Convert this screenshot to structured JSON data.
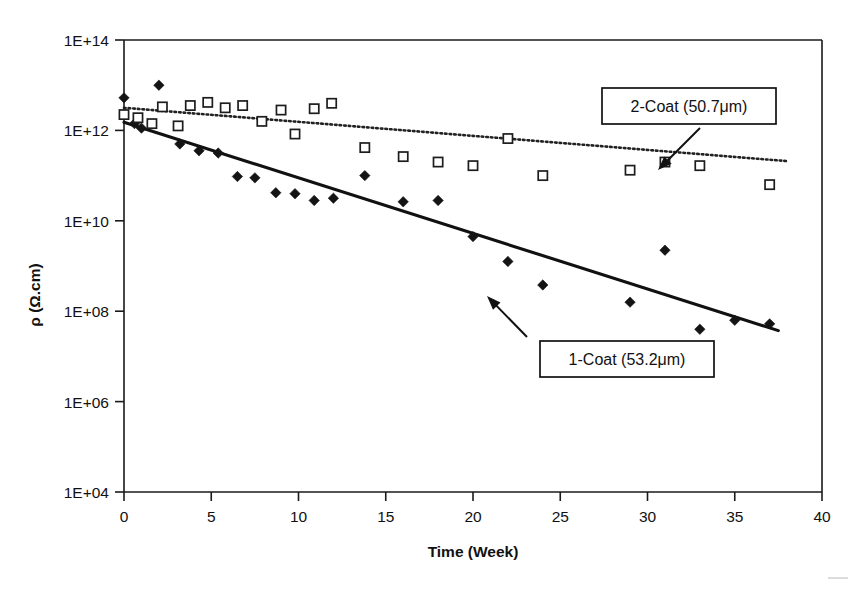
{
  "chart_data": {
    "type": "scatter",
    "title": "",
    "xlabel": "Time (Week)",
    "ylabel": "ρ (Ω.cm)",
    "xlim": [
      0,
      40
    ],
    "ylim_exponent": [
      4,
      14
    ],
    "y_scale": "log",
    "grid": false,
    "legend_position": "inside-annotations",
    "x_ticks": [
      "0",
      "5",
      "10",
      "15",
      "20",
      "25",
      "30",
      "35",
      "40"
    ],
    "x_tick_values": [
      0,
      5,
      10,
      15,
      20,
      25,
      30,
      35,
      40
    ],
    "y_ticks": [
      "1E+04",
      "1E+06",
      "1E+08",
      "1E+10",
      "1E+12",
      "1E+14"
    ],
    "y_tick_exponents": [
      4,
      6,
      8,
      10,
      12,
      14
    ],
    "series": [
      {
        "name": "1-Coat (53.2μm)",
        "marker": "filled-diamond",
        "fit_style": "solid",
        "fit_start": {
          "x": 0,
          "y_exponent": 12.18
        },
        "fit_end": {
          "x": 37.5,
          "y_exponent": 7.57
        },
        "points": [
          {
            "x": 0.0,
            "y_exponent": 12.72
          },
          {
            "x": 0.6,
            "y_exponent": 12.15
          },
          {
            "x": 1.0,
            "y_exponent": 12.05
          },
          {
            "x": 2.0,
            "y_exponent": 13.0
          },
          {
            "x": 3.2,
            "y_exponent": 11.7
          },
          {
            "x": 4.3,
            "y_exponent": 11.55
          },
          {
            "x": 5.4,
            "y_exponent": 11.5
          },
          {
            "x": 6.5,
            "y_exponent": 10.98
          },
          {
            "x": 7.5,
            "y_exponent": 10.95
          },
          {
            "x": 8.7,
            "y_exponent": 10.62
          },
          {
            "x": 9.8,
            "y_exponent": 10.6
          },
          {
            "x": 10.9,
            "y_exponent": 10.45
          },
          {
            "x": 12.0,
            "y_exponent": 10.5
          },
          {
            "x": 13.8,
            "y_exponent": 11.0
          },
          {
            "x": 16.0,
            "y_exponent": 10.42
          },
          {
            "x": 18.0,
            "y_exponent": 10.45
          },
          {
            "x": 20.0,
            "y_exponent": 9.65
          },
          {
            "x": 22.0,
            "y_exponent": 9.1
          },
          {
            "x": 24.0,
            "y_exponent": 8.58
          },
          {
            "x": 29.0,
            "y_exponent": 8.2
          },
          {
            "x": 31.0,
            "y_exponent": 9.35
          },
          {
            "x": 33.0,
            "y_exponent": 7.6
          },
          {
            "x": 35.0,
            "y_exponent": 7.8
          },
          {
            "x": 37.0,
            "y_exponent": 7.72
          }
        ]
      },
      {
        "name": "2-Coat (50.7μm)",
        "marker": "open-square",
        "fit_style": "dotted",
        "fit_start": {
          "x": 0,
          "y_exponent": 12.5
        },
        "fit_end": {
          "x": 38.0,
          "y_exponent": 11.32
        },
        "points": [
          {
            "x": 0.0,
            "y_exponent": 12.35
          },
          {
            "x": 0.8,
            "y_exponent": 12.28
          },
          {
            "x": 1.6,
            "y_exponent": 12.15
          },
          {
            "x": 2.2,
            "y_exponent": 12.52
          },
          {
            "x": 3.1,
            "y_exponent": 12.1
          },
          {
            "x": 3.8,
            "y_exponent": 12.55
          },
          {
            "x": 4.8,
            "y_exponent": 12.62
          },
          {
            "x": 5.8,
            "y_exponent": 12.5
          },
          {
            "x": 6.8,
            "y_exponent": 12.55
          },
          {
            "x": 7.9,
            "y_exponent": 12.2
          },
          {
            "x": 9.0,
            "y_exponent": 12.45
          },
          {
            "x": 9.8,
            "y_exponent": 11.92
          },
          {
            "x": 10.9,
            "y_exponent": 12.48
          },
          {
            "x": 11.9,
            "y_exponent": 12.6
          },
          {
            "x": 13.8,
            "y_exponent": 11.62
          },
          {
            "x": 16.0,
            "y_exponent": 11.42
          },
          {
            "x": 18.0,
            "y_exponent": 11.3
          },
          {
            "x": 20.0,
            "y_exponent": 11.22
          },
          {
            "x": 22.0,
            "y_exponent": 11.82
          },
          {
            "x": 24.0,
            "y_exponent": 11.0
          },
          {
            "x": 29.0,
            "y_exponent": 11.12
          },
          {
            "x": 31.0,
            "y_exponent": 11.3
          },
          {
            "x": 33.0,
            "y_exponent": 11.22
          },
          {
            "x": 37.0,
            "y_exponent": 10.8
          }
        ]
      }
    ],
    "annotations": [
      {
        "id": "annotation-2coat",
        "label": "2-Coat (50.7μm)",
        "box": {
          "x": 602,
          "y": 88,
          "w": 174,
          "h": 36
        },
        "arrow": {
          "from_x": 700,
          "from_y": 128,
          "to_x": 658,
          "to_y": 170
        }
      },
      {
        "id": "annotation-1coat",
        "label": "1-Coat (53.2μm)",
        "box": {
          "x": 540,
          "y": 341,
          "w": 174,
          "h": 36
        },
        "arrow": {
          "from_x": 527,
          "from_y": 337,
          "to_x": 487,
          "to_y": 296
        }
      }
    ]
  },
  "axes": {
    "x_title": "Time (Week)",
    "y_title": "ρ (Ω.cm)"
  }
}
